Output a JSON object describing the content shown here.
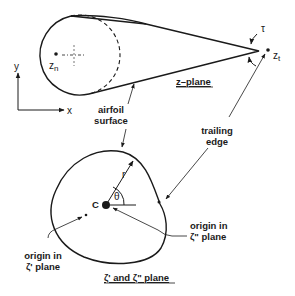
{
  "figure": {
    "z_plane": {
      "title": "z–plane",
      "leading_point_label": "z",
      "leading_point_sub": "n",
      "trailing_point_label": "z",
      "trailing_point_sub": "t",
      "angle_label": "τ",
      "axis_x_label": "x",
      "axis_y_label": "y"
    },
    "labels": {
      "airfoil_surface_line1": "airfoil",
      "airfoil_surface_line2": "surface",
      "trailing_edge_line1": "trailing",
      "trailing_edge_line2": "edge"
    },
    "zeta_plane": {
      "title": "ζ' and ζ\" plane",
      "center_label": "C",
      "radius_label": "r",
      "angle_label": "θ",
      "origin1_line1": "origin in",
      "origin1_line2": "ζ' plane",
      "origin2_line1": "origin in",
      "origin2_line2": "ζ\" plane"
    },
    "colors": {
      "ink": "#1a1a1a",
      "background": "#ffffff"
    }
  }
}
